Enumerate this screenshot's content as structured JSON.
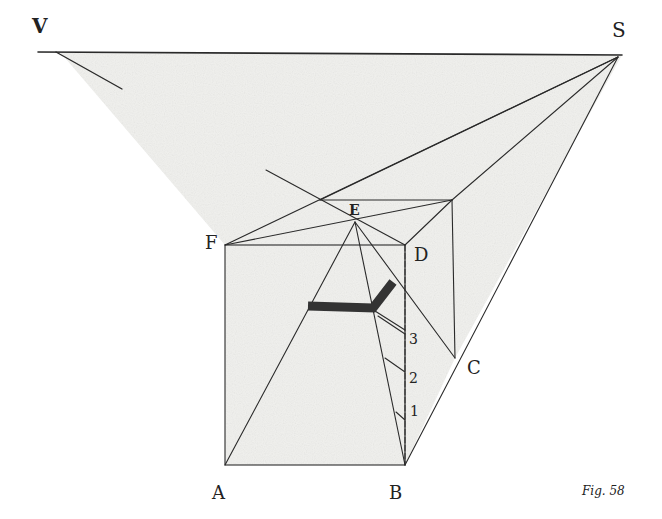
{
  "figure": {
    "caption": "Fig. 58",
    "caption_prefix": "Fig.",
    "caption_number": "58",
    "colors": {
      "ink": "#2a2a2a",
      "shade": "#e9e9e6",
      "paper": "#ffffff",
      "band": "#333333"
    }
  },
  "labels": {
    "V": "V",
    "S": "S",
    "E": "E",
    "F": "F",
    "D": "D",
    "C": "C",
    "A": "A",
    "B": "B",
    "n1": "1",
    "n2": "2",
    "n3": "3"
  },
  "points": {
    "horizon_left": [
      38,
      52
    ],
    "horizon_right": [
      622,
      55
    ],
    "S": [
      618,
      57
    ],
    "V_line_start": [
      56,
      52
    ],
    "V_line_end": [
      122,
      89
    ],
    "F": [
      225,
      245
    ],
    "D": [
      405,
      245
    ],
    "A": [
      225,
      465
    ],
    "B": [
      405,
      465
    ],
    "C": [
      455,
      358
    ],
    "back_top_right": [
      452,
      200
    ],
    "back_top_left": [
      320,
      200
    ],
    "E": [
      355,
      222
    ]
  }
}
